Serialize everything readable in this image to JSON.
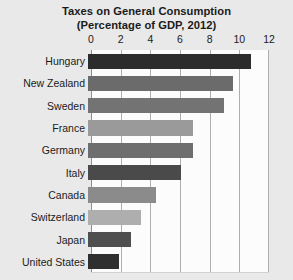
{
  "chart_data": {
    "type": "bar",
    "orientation": "horizontal",
    "title": "Taxes on General Consumption",
    "subtitle": "(Percentage of GDP, 2012)",
    "xlabel": "",
    "ylabel": "",
    "xlim": [
      0,
      12
    ],
    "xticks": [
      0,
      2,
      4,
      6,
      8,
      10,
      12
    ],
    "xtick_labels": [
      "0",
      "2",
      "4",
      "6",
      "8",
      "10",
      "12"
    ],
    "grid": true,
    "grid_axis": "x",
    "legend": false,
    "categories": [
      "Hungary",
      "New Zealand",
      "Sweden",
      "France",
      "Germany",
      "Italy",
      "Canada",
      "Switzerland",
      "Japan",
      "United States"
    ],
    "values": [
      11.0,
      9.8,
      9.2,
      7.1,
      7.1,
      6.3,
      4.6,
      3.6,
      2.9,
      2.1
    ],
    "bar_colors": [
      "#2c2c2c",
      "#6b6b6b",
      "#737373",
      "#9a9a9a",
      "#6e6e6e",
      "#4a4a4a",
      "#8b8b8b",
      "#aeaeae",
      "#4f4f4f",
      "#2f2f2f"
    ],
    "bars": [
      {
        "label": "Hungary",
        "value": 11.0,
        "color": "#2c2c2c"
      },
      {
        "label": "New Zealand",
        "value": 9.8,
        "color": "#6b6b6b"
      },
      {
        "label": "Sweden",
        "value": 9.2,
        "color": "#737373"
      },
      {
        "label": "France",
        "value": 7.1,
        "color": "#9a9a9a"
      },
      {
        "label": "Germany",
        "value": 7.1,
        "color": "#6e6e6e"
      },
      {
        "label": "Italy",
        "value": 6.3,
        "color": "#4a4a4a"
      },
      {
        "label": "Canada",
        "value": 4.6,
        "color": "#8b8b8b"
      },
      {
        "label": "Switzerland",
        "value": 3.6,
        "color": "#aeaeae"
      },
      {
        "label": "Japan",
        "value": 2.9,
        "color": "#4f4f4f"
      },
      {
        "label": "United States",
        "value": 2.1,
        "color": "#2f2f2f"
      }
    ]
  },
  "figure": {
    "background_color": "#e9e9e9",
    "plot_background_color": "#fcfcfc",
    "gridline_color": "#aeaeae",
    "text_color": "#1b1b1b"
  }
}
